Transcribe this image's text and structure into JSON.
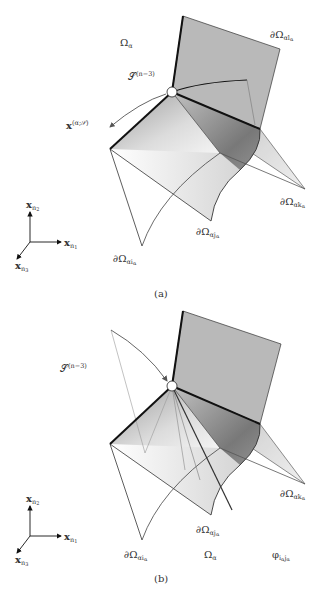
{
  "figure": {
    "panels": [
      {
        "id": "a",
        "caption": "(a)",
        "labels": {
          "domain": {
            "base": "Ω",
            "sub": "α"
          },
          "subspace": {
            "base": "𝒮",
            "sup": "(n−3)"
          },
          "point": {
            "base": "x",
            "sup": "(α;𝒮)"
          },
          "boundary_l": {
            "base": "∂Ω",
            "sub": "αl",
            "subsub": "α"
          },
          "boundary_k": {
            "base": "∂Ω",
            "sub": "αk",
            "subsub": "α"
          },
          "boundary_j": {
            "base": "∂Ω",
            "sub": "αj",
            "subsub": "α"
          },
          "boundary_i": {
            "base": "∂Ω",
            "sub": "αi",
            "subsub": "α"
          }
        },
        "axes": {
          "x2": {
            "base": "x",
            "sub": "n",
            "subsub": "2"
          },
          "x1": {
            "base": "x",
            "sub": "n",
            "subsub": "1"
          },
          "x3": {
            "base": "x",
            "sub": "n",
            "subsub": "3"
          }
        }
      },
      {
        "id": "b",
        "caption": "(b)",
        "labels": {
          "subspace": {
            "base": "𝒮",
            "sup": "(n−3)"
          },
          "boundary_k": {
            "base": "∂Ω",
            "sub": "αk",
            "subsub": "α"
          },
          "boundary_j": {
            "base": "∂Ω",
            "sub": "αj",
            "subsub": "α"
          },
          "boundary_i": {
            "base": "∂Ω",
            "sub": "αi",
            "subsub": "α"
          },
          "domain": {
            "base": "Ω",
            "sub": "α"
          },
          "angle": {
            "base": "φ",
            "sub": "i",
            "subsub": "α",
            "sub2": "j",
            "subsub2": "α"
          }
        },
        "axes": {
          "x2": {
            "base": "x",
            "sub": "n",
            "subsub": "2"
          },
          "x1": {
            "base": "x",
            "sub": "n",
            "subsub": "1"
          },
          "x3": {
            "base": "x",
            "sub": "n",
            "subsub": "3"
          }
        }
      }
    ],
    "colors": {
      "plane_fill": "#b9b9b9",
      "edge_dark": "#111111",
      "edge_thin": "#444444",
      "arrow": "#666666"
    }
  }
}
